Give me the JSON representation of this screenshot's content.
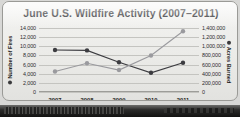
{
  "chart_data": {
    "type": "line",
    "title": "June U.S. Wildfire Activity (2007–2011)",
    "categories": [
      "2007",
      "2008",
      "2009",
      "2010",
      "2011"
    ],
    "x": [
      2007,
      2008,
      2009,
      2010,
      2011
    ],
    "xlabel": "",
    "grid": true,
    "legend": "none",
    "series": [
      {
        "name": "Number of Fires",
        "axis": "left",
        "color": "#3c3c40",
        "marker": "circle",
        "values": [
          9200,
          9100,
          6500,
          4200,
          6400
        ]
      },
      {
        "name": "Acres Burned",
        "axis": "right",
        "color": "#9a9a9e",
        "marker": "circle",
        "values": [
          450000,
          630000,
          480000,
          800000,
          1330000
        ]
      }
    ],
    "axes": {
      "left": {
        "label": "Number of Fires",
        "ylim": [
          0,
          14000
        ],
        "ticks": [
          0,
          2000,
          4000,
          6000,
          8000,
          10000,
          12000,
          14000
        ],
        "ticklabels": [
          "0",
          "2,000",
          "4,000",
          "6,000",
          "8,000",
          "10,000",
          "12,000",
          "14,000"
        ]
      },
      "right": {
        "label": "Acres Burned",
        "ylim": [
          0,
          1400000
        ],
        "ticks": [
          0,
          200000,
          400000,
          600000,
          800000,
          1000000,
          1200000,
          1400000
        ],
        "ticklabels": [
          "0",
          "200,000",
          "400,000",
          "600,000",
          "800,000",
          "1,000,000",
          "1,200,000",
          "1,400,000"
        ]
      }
    }
  },
  "colors": {
    "card_background": "#eeeeeb",
    "border": "#9a9a96",
    "gridline": "#c4c4c0",
    "fires_series": "#3c3c40",
    "acres_series": "#9a9a9e",
    "text": "#1d1d20",
    "page_edge": "#1b1b1a"
  }
}
